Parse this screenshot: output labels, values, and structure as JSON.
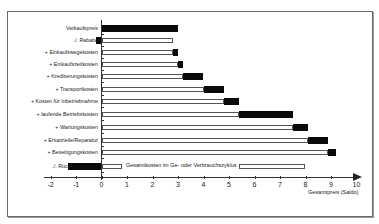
{
  "chart_data": {
    "type": "bar",
    "subtype": "horizontal-waterfall",
    "title": "",
    "xlabel": "Gesamtpreis (Saldo)",
    "ylabel": "",
    "xlim": [
      -2,
      10
    ],
    "xticks": [
      "-2",
      "-1",
      "0",
      "1",
      "2",
      "3",
      "4",
      "5",
      "6",
      "7",
      "8",
      "9",
      "10"
    ],
    "grid": false,
    "legend": null,
    "categories": [
      "Verkaufspreis",
      "./. Rabatte",
      "+ Einkaufswegekosten",
      "+ Einkaufszeitkosten",
      "+ Kreditierungskosten",
      "+ Transportkosten",
      "+ Kosten für Inbetriebnahme",
      "+ laufende Betriebskosten",
      "+ Wartungskosten",
      "+ Ersatzteile/Reparatur",
      "+ Beseitigungskosten",
      "./. Rücknahmepreis"
    ],
    "series": [
      {
        "name": "cumulative (white base)",
        "values": [
          0,
          2.8,
          2.8,
          3.0,
          3.2,
          4.0,
          4.8,
          5.4,
          7.5,
          8.1,
          8.9,
          0.8
        ]
      },
      {
        "name": "increment (black)",
        "values": [
          3.0,
          -0.2,
          0.2,
          0.2,
          0.8,
          0.8,
          0.6,
          2.1,
          0.6,
          0.8,
          0.3,
          -1.3
        ]
      }
    ],
    "bars": [
      {
        "label": "Verkaufspreis",
        "white": null,
        "black": [
          0,
          3.0
        ]
      },
      {
        "label": "./. Rabatte",
        "white": [
          0,
          2.8
        ],
        "black": [
          -0.2,
          0
        ]
      },
      {
        "label": "+ Einkaufswegekosten",
        "white": [
          0,
          2.8
        ],
        "black": [
          2.8,
          3.0
        ]
      },
      {
        "label": "+ Einkaufszeitkosten",
        "white": [
          0,
          3.0
        ],
        "black": [
          3.0,
          3.2
        ]
      },
      {
        "label": "+ Kreditierungskosten",
        "white": [
          0,
          3.2
        ],
        "black": [
          3.2,
          4.0
        ]
      },
      {
        "label": "+ Transportkosten",
        "white": [
          0,
          4.0
        ],
        "black": [
          4.0,
          4.8
        ]
      },
      {
        "label": "+ Kosten für Inbetriebnahme",
        "white": [
          0,
          4.8
        ],
        "black": [
          4.8,
          5.4
        ]
      },
      {
        "label": "+ laufende Betriebskosten",
        "white": [
          0,
          5.4
        ],
        "black": [
          5.4,
          7.5
        ]
      },
      {
        "label": "+ Wartungskosten",
        "white": [
          0,
          7.5
        ],
        "black": [
          7.5,
          8.1
        ]
      },
      {
        "label": "+ Ersatzteile/Reparatur",
        "white": [
          0,
          8.1
        ],
        "black": [
          8.1,
          8.9
        ]
      },
      {
        "label": "+ Beseitigungskosten",
        "white": [
          0,
          8.9
        ],
        "black": [
          8.9,
          9.2
        ]
      },
      {
        "label": "./. Rücknahmepreis",
        "white": [
          0,
          0.8
        ],
        "black": [
          -1.3,
          0
        ],
        "total_box": [
          5.4,
          8.0
        ]
      }
    ],
    "annotations": [
      "Gesamtkosten im Ge- oder Verbrauchszyklus"
    ]
  },
  "axis": {
    "zero_px": 101.5,
    "px_per_unit": 25.5
  },
  "rows_px_y": [
    28,
    40,
    52,
    64,
    76,
    89,
    101,
    114,
    127,
    140,
    152,
    166
  ]
}
